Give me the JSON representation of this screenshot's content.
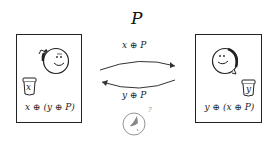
{
  "diagram": {
    "title": "P",
    "top_arrow_label": "x ⊕ P",
    "bottom_arrow_label": "y ⊕ P",
    "left_party": {
      "jar_label": "x",
      "expression": "x ⊕ (y ⊕ P)"
    },
    "right_party": {
      "jar_label": "y",
      "expression": "y ⊕ (x ⊕ P)"
    },
    "eavesdropper_mark": "?",
    "colors": {
      "stroke": "#222222",
      "faint": "#888888",
      "background": "#ffffff"
    }
  }
}
